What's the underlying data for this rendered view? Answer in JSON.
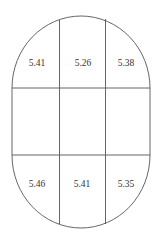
{
  "diagram": {
    "shape": "stadium",
    "stroke_color": "#555555",
    "background": "#ffffff",
    "grid": {
      "rows": 3,
      "cols": 3
    },
    "cells": {
      "top": [
        "5.41",
        "5.26",
        "5.38"
      ],
      "middle": [
        "",
        "",
        ""
      ],
      "bottom": [
        "5.46",
        "5.41",
        "5.35"
      ]
    }
  }
}
